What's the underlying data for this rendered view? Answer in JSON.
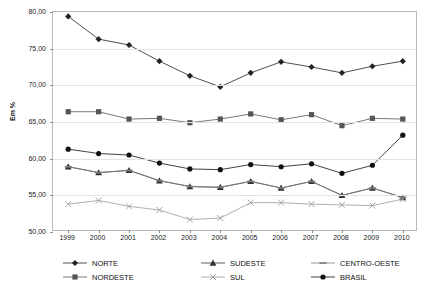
{
  "chart_data": {
    "type": "line",
    "title": "",
    "xlabel": "",
    "ylabel": "Em %",
    "ylim": [
      50.0,
      80.0
    ],
    "yticks": [
      "50,00",
      "55,00",
      "60,00",
      "65,00",
      "70,00",
      "75,00",
      "80,00"
    ],
    "ytick_values": [
      50.0,
      55.0,
      60.0,
      65.0,
      70.0,
      75.0,
      80.0
    ],
    "grid": true,
    "legend_position": "bottom",
    "decimal_separator": ",",
    "categories": [
      "1999",
      "2000",
      "2001",
      "2002",
      "2003",
      "2004",
      "2005",
      "2006",
      "2007",
      "2008",
      "2009",
      "2010"
    ],
    "x": [
      1999,
      2000,
      2001,
      2002,
      2003,
      2004,
      2005,
      2006,
      2007,
      2008,
      2009,
      2010
    ],
    "series": [
      {
        "name": "NORTE",
        "marker": "diamond",
        "color": "#222222",
        "values": [
          79.4,
          76.3,
          75.5,
          73.3,
          71.3,
          69.8,
          71.7,
          73.2,
          72.5,
          71.7,
          72.6,
          73.3
        ]
      },
      {
        "name": "NORDESTE",
        "marker": "square",
        "color": "#555555",
        "values": [
          66.4,
          66.4,
          65.4,
          65.5,
          64.9,
          65.4,
          66.1,
          65.3,
          66.0,
          64.5,
          65.5,
          65.4
        ]
      },
      {
        "name": "SUDESTE",
        "marker": "triangle",
        "color": "#333333",
        "values": [
          58.9,
          58.1,
          58.4,
          57.0,
          56.2,
          56.1,
          56.9,
          56.0,
          56.9,
          55.0,
          56.0,
          54.7
        ]
      },
      {
        "name": "SUL",
        "marker": "cross",
        "color": "#9a9a9a",
        "values": [
          53.8,
          54.3,
          53.5,
          53.0,
          51.7,
          51.9,
          54.0,
          54.0,
          53.8,
          53.7,
          53.6,
          54.5
        ]
      },
      {
        "name": "CENTRO-OESTE",
        "marker": "dash",
        "color": "#7d7d7d",
        "values": [
          58.9,
          58.1,
          58.4,
          57.0,
          56.2,
          56.1,
          56.9,
          56.0,
          56.9,
          55.0,
          56.0,
          54.7
        ]
      },
      {
        "name": "BRASIL",
        "marker": "circle",
        "color": "#111111",
        "values": [
          61.3,
          60.7,
          60.5,
          59.4,
          58.6,
          58.5,
          59.2,
          58.9,
          59.3,
          58.0,
          59.1,
          63.2
        ]
      }
    ]
  },
  "legend": {
    "items": [
      {
        "label": "NORTE",
        "marker": "diamond",
        "color": "#222222"
      },
      {
        "label": "SUDESTE",
        "marker": "triangle",
        "color": "#333333"
      },
      {
        "label": "CENTRO-OESTE",
        "marker": "dash",
        "color": "#7d7d7d"
      },
      {
        "label": "NORDESTE",
        "marker": "square",
        "color": "#555555"
      },
      {
        "label": "SUL",
        "marker": "cross",
        "color": "#9a9a9a"
      },
      {
        "label": "BRASIL",
        "marker": "circle",
        "color": "#111111"
      }
    ]
  },
  "axes": {
    "y_label": "Em %",
    "plot_border_color": "#b9b9b9",
    "grid_color": "#e3e3e3"
  }
}
